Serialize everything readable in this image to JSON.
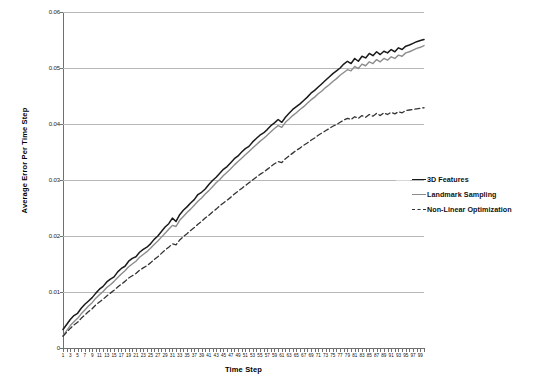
{
  "chart_data": {
    "type": "line",
    "title": "",
    "xlabel": "Time Step",
    "ylabel": "Average Error Per Time Step",
    "xlim": [
      1,
      99
    ],
    "ylim": [
      0,
      0.06
    ],
    "grid": true,
    "legend_position": "right",
    "ytick_labels": [
      "0.06",
      "0.05",
      "0.04",
      "0.03",
      "0.02",
      "0.01",
      "0"
    ],
    "ytick_values": [
      0.06,
      0.05,
      0.04,
      0.03,
      0.02,
      0.01,
      0
    ],
    "xtick_labels": [
      "1",
      "3",
      "5",
      "7",
      "9",
      "11",
      "13",
      "15",
      "17",
      "19",
      "21",
      "23",
      "25",
      "27",
      "29",
      "31",
      "33",
      "35",
      "37",
      "39",
      "41",
      "43",
      "45",
      "47",
      "49",
      "51",
      "53",
      "55",
      "57",
      "59",
      "61",
      "63",
      "65",
      "67",
      "69",
      "71",
      "73",
      "75",
      "77",
      "79",
      "81",
      "83",
      "85",
      "87",
      "89",
      "91",
      "93",
      "95",
      "97",
      "99"
    ],
    "x": [
      1,
      2,
      3,
      4,
      5,
      6,
      7,
      8,
      9,
      10,
      11,
      12,
      13,
      14,
      15,
      16,
      17,
      18,
      19,
      20,
      21,
      22,
      23,
      24,
      25,
      26,
      27,
      28,
      29,
      30,
      31,
      32,
      33,
      34,
      35,
      36,
      37,
      38,
      39,
      40,
      41,
      42,
      43,
      44,
      45,
      46,
      47,
      48,
      49,
      50,
      51,
      52,
      53,
      54,
      55,
      56,
      57,
      58,
      59,
      60,
      61,
      62,
      63,
      64,
      65,
      66,
      67,
      68,
      69,
      70,
      71,
      72,
      73,
      74,
      75,
      76,
      77,
      78,
      79,
      80,
      81,
      82,
      83,
      84,
      85,
      86,
      87,
      88,
      89,
      90,
      91,
      92,
      93,
      94,
      95,
      96,
      97,
      98,
      99,
      100
    ],
    "series": [
      {
        "name": "3D Features",
        "color": "#1a1a1a",
        "style": "solid",
        "width": 1.5,
        "values": [
          0.0033,
          0.0042,
          0.0051,
          0.0058,
          0.0062,
          0.0071,
          0.0078,
          0.0084,
          0.009,
          0.0098,
          0.0105,
          0.011,
          0.0118,
          0.0123,
          0.0127,
          0.0136,
          0.0142,
          0.0146,
          0.0155,
          0.016,
          0.0163,
          0.0171,
          0.0176,
          0.018,
          0.0186,
          0.0194,
          0.02,
          0.0208,
          0.0216,
          0.0222,
          0.0232,
          0.0226,
          0.0238,
          0.0246,
          0.0252,
          0.0259,
          0.0265,
          0.0274,
          0.0278,
          0.0284,
          0.0292,
          0.0299,
          0.0305,
          0.0312,
          0.0319,
          0.0324,
          0.0331,
          0.0338,
          0.0343,
          0.035,
          0.0356,
          0.036,
          0.0368,
          0.0374,
          0.038,
          0.0384,
          0.039,
          0.0397,
          0.0402,
          0.0408,
          0.0403,
          0.0412,
          0.0419,
          0.0426,
          0.0431,
          0.0436,
          0.0442,
          0.0448,
          0.0455,
          0.046,
          0.0466,
          0.0472,
          0.0478,
          0.0484,
          0.049,
          0.0495,
          0.05,
          0.0507,
          0.0512,
          0.0508,
          0.0517,
          0.0512,
          0.0521,
          0.0518,
          0.0526,
          0.0522,
          0.0529,
          0.0524,
          0.053,
          0.0527,
          0.0533,
          0.0529,
          0.0536,
          0.0533,
          0.0539,
          0.0541,
          0.0544,
          0.0547,
          0.0549,
          0.0551
        ]
      },
      {
        "name": "Landmark Sampling",
        "color": "#8c8c8c",
        "style": "solid",
        "width": 1.4,
        "values": [
          0.0022,
          0.0031,
          0.004,
          0.0047,
          0.0053,
          0.0061,
          0.0068,
          0.0075,
          0.0081,
          0.0089,
          0.0095,
          0.0101,
          0.0108,
          0.0113,
          0.0119,
          0.0126,
          0.0132,
          0.0138,
          0.0145,
          0.015,
          0.0155,
          0.0162,
          0.0167,
          0.0172,
          0.0178,
          0.0185,
          0.0191,
          0.0198,
          0.0205,
          0.0212,
          0.0219,
          0.0217,
          0.0228,
          0.0235,
          0.0242,
          0.0248,
          0.0255,
          0.0262,
          0.0268,
          0.0275,
          0.0281,
          0.0288,
          0.0295,
          0.0301,
          0.0308,
          0.0314,
          0.032,
          0.0327,
          0.0333,
          0.0339,
          0.0345,
          0.0351,
          0.0357,
          0.0363,
          0.0369,
          0.0374,
          0.038,
          0.0386,
          0.0392,
          0.0397,
          0.0394,
          0.0403,
          0.0409,
          0.0415,
          0.042,
          0.0426,
          0.0431,
          0.0437,
          0.0443,
          0.0448,
          0.0454,
          0.0459,
          0.0465,
          0.047,
          0.0476,
          0.0481,
          0.0487,
          0.0492,
          0.0497,
          0.0495,
          0.0503,
          0.0499,
          0.0507,
          0.0504,
          0.0511,
          0.0508,
          0.0515,
          0.0511,
          0.0517,
          0.0514,
          0.052,
          0.0517,
          0.0523,
          0.0521,
          0.0527,
          0.0529,
          0.0532,
          0.0535,
          0.0537,
          0.054
        ]
      },
      {
        "name": "Non-Linear Optimization",
        "color": "#333333",
        "style": "dashed",
        "width": 1.3,
        "values": [
          0.0021,
          0.0028,
          0.0035,
          0.0041,
          0.0046,
          0.0053,
          0.0059,
          0.0065,
          0.007,
          0.0077,
          0.0082,
          0.0087,
          0.0093,
          0.0098,
          0.0103,
          0.0109,
          0.0114,
          0.0119,
          0.0125,
          0.0129,
          0.0133,
          0.0139,
          0.0143,
          0.0147,
          0.0152,
          0.0158,
          0.0163,
          0.0169,
          0.0175,
          0.018,
          0.0186,
          0.0184,
          0.0193,
          0.0199,
          0.0204,
          0.021,
          0.0215,
          0.0221,
          0.0226,
          0.0232,
          0.0237,
          0.0243,
          0.0248,
          0.0254,
          0.0259,
          0.0264,
          0.0269,
          0.0275,
          0.028,
          0.0285,
          0.029,
          0.0295,
          0.03,
          0.0305,
          0.031,
          0.0314,
          0.0319,
          0.0324,
          0.0329,
          0.0333,
          0.0331,
          0.0338,
          0.0343,
          0.0348,
          0.0353,
          0.0357,
          0.0362,
          0.0366,
          0.0371,
          0.0375,
          0.038,
          0.0384,
          0.0388,
          0.0392,
          0.0396,
          0.0399,
          0.0403,
          0.0407,
          0.041,
          0.0408,
          0.0413,
          0.041,
          0.0415,
          0.0412,
          0.0417,
          0.0414,
          0.0419,
          0.0415,
          0.042,
          0.0417,
          0.0421,
          0.0418,
          0.0422,
          0.042,
          0.0424,
          0.0425,
          0.0426,
          0.0427,
          0.0428,
          0.0429
        ]
      }
    ]
  },
  "legend": {
    "items": [
      {
        "label": "3D Features"
      },
      {
        "label": "Landmark Sampling"
      },
      {
        "label": "Non-Linear Optimization"
      }
    ]
  }
}
